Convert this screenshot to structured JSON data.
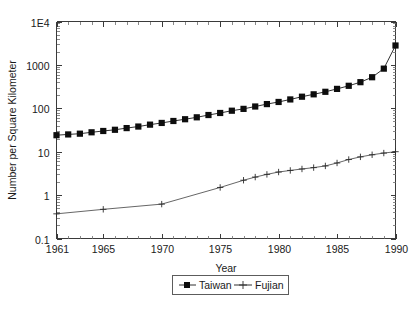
{
  "chart_data": {
    "type": "line",
    "title": "",
    "xlabel": "Year",
    "ylabel": "Number per Square Kilometer",
    "yscale": "log",
    "ylim": [
      0.1,
      10000
    ],
    "xlim": [
      1961,
      1990
    ],
    "grid": false,
    "legend_position": "below-outside",
    "y_tick_labels": [
      "1E4",
      "1000",
      "100",
      "10",
      "1",
      "0.1"
    ],
    "y_tick_values": [
      10000,
      1000,
      100,
      10,
      1,
      0.1
    ],
    "x_tick_labels": [
      "1961",
      "1965",
      "1970",
      "1975",
      "1980",
      "1985",
      "1990"
    ],
    "x_tick_values": [
      1961,
      1965,
      1970,
      1975,
      1980,
      1985,
      1990
    ],
    "series": [
      {
        "name": "Taiwan",
        "marker": "filled-square",
        "x": [
          1961,
          1962,
          1963,
          1964,
          1965,
          1966,
          1967,
          1968,
          1969,
          1970,
          1971,
          1972,
          1973,
          1974,
          1975,
          1976,
          1977,
          1978,
          1979,
          1980,
          1981,
          1982,
          1983,
          1984,
          1985,
          1986,
          1987,
          1988,
          1989,
          1990
        ],
        "values": [
          24,
          25,
          26,
          28,
          30,
          32,
          35,
          38,
          42,
          46,
          51,
          56,
          62,
          70,
          78,
          88,
          97,
          110,
          125,
          140,
          160,
          185,
          210,
          240,
          280,
          330,
          400,
          520,
          820,
          2800
        ]
      },
      {
        "name": "Fujian",
        "marker": "plus",
        "x": [
          1961,
          1965,
          1970,
          1975,
          1977,
          1978,
          1979,
          1980,
          1981,
          1982,
          1983,
          1984,
          1985,
          1986,
          1987,
          1988,
          1989,
          1990
        ],
        "values": [
          0.37,
          0.47,
          0.62,
          1.5,
          2.2,
          2.6,
          3.0,
          3.4,
          3.7,
          4.0,
          4.3,
          4.7,
          5.5,
          6.6,
          7.6,
          8.5,
          9.3,
          10.0
        ]
      }
    ]
  },
  "legend": {
    "entries": [
      {
        "label": "Taiwan"
      },
      {
        "label": "Fujian"
      }
    ]
  },
  "colors": {
    "series_taiwan": "#0d0d0d",
    "series_fujian": "#2b2b2b",
    "axis": "#3a3a3a",
    "background": "#ffffff"
  }
}
